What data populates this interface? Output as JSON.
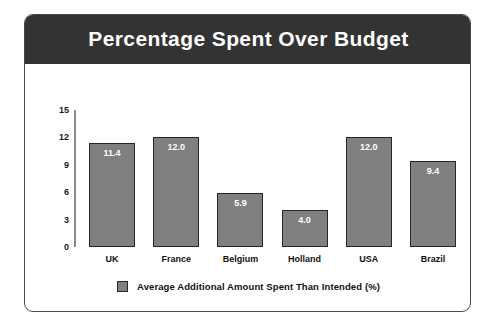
{
  "card": {
    "title": "Percentage Spent Over Budget"
  },
  "legend": {
    "swatch_color": "#808080",
    "label": "Average Additional Amount Spent Than Intended (%)"
  },
  "colors": {
    "header_background": "#333333",
    "header_text": "#ffffff",
    "bar_fill": "#808080",
    "bar_stroke": "#262626",
    "axis_line": "#8c8c8c",
    "card_border": "#4a4a4a",
    "value_label": "#ffffff"
  },
  "chart_data": {
    "type": "bar",
    "title": "Percentage Spent Over Budget",
    "xlabel": "",
    "ylabel": "",
    "categories": [
      "UK",
      "France",
      "Belgium",
      "Holland",
      "USA",
      "Brazil"
    ],
    "values": [
      11.4,
      12.0,
      5.9,
      4.0,
      12.0,
      9.4
    ],
    "value_labels": [
      "11.4",
      "12.0",
      "5.9",
      "4.0",
      "12.0",
      "9.4"
    ],
    "series": [
      {
        "name": "Average Additional Amount Spent Than Intended (%)",
        "values": [
          11.4,
          12.0,
          5.9,
          4.0,
          12.0,
          9.4
        ]
      }
    ],
    "ylim": [
      0,
      15
    ],
    "yticks": [
      0,
      3,
      6,
      9,
      12,
      15
    ],
    "ytick_labels": [
      "0",
      "3",
      "6",
      "9",
      "12",
      "15"
    ],
    "grid": false,
    "legend_position": "bottom"
  }
}
